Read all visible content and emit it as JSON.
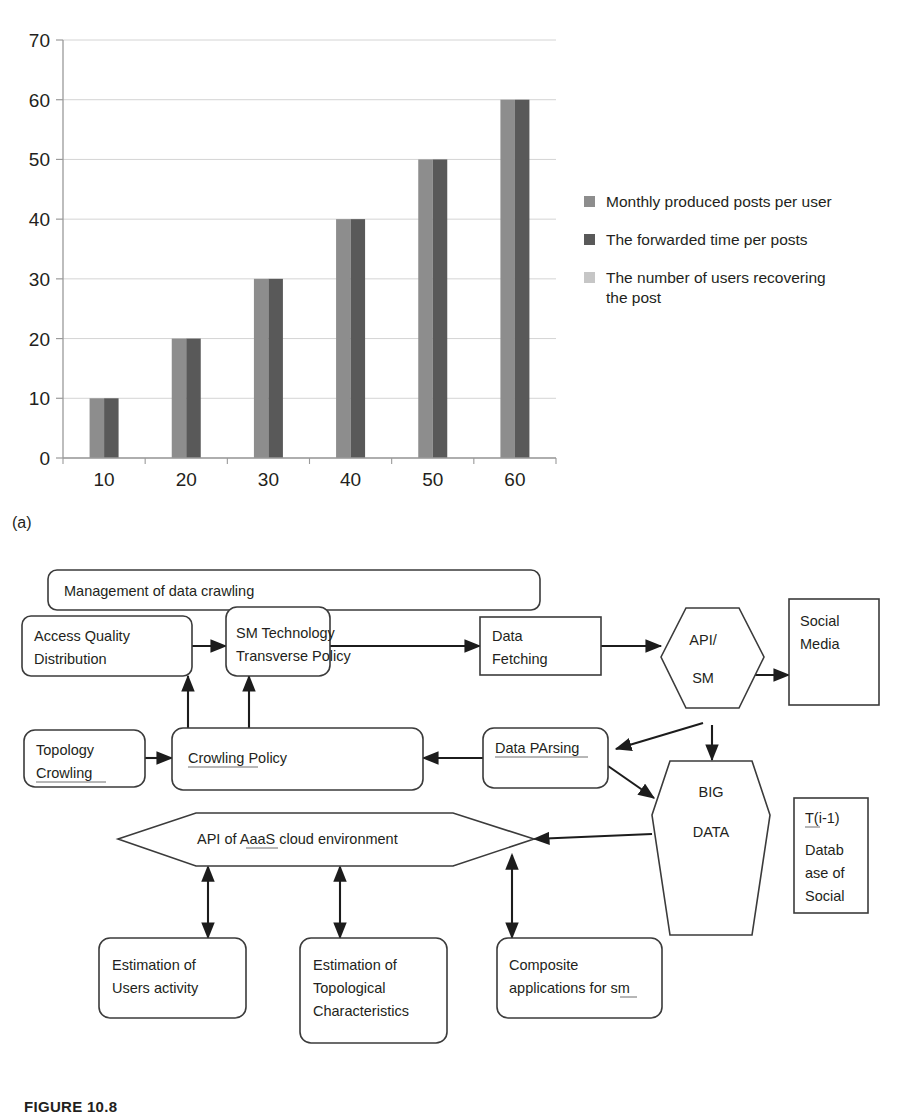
{
  "figure": {
    "caption": "FIGURE 10.8",
    "panel_a_label": "(a)",
    "panel_b_label": "(b)"
  },
  "chart_data": {
    "type": "bar",
    "title": "",
    "xlabel": "",
    "ylabel": "",
    "categories": [
      "10",
      "20",
      "30",
      "40",
      "50",
      "60"
    ],
    "x": [
      10,
      20,
      30,
      40,
      50,
      60
    ],
    "series": [
      {
        "name": "Monthly produced posts per user",
        "color": "#8d8d8d",
        "values": [
          10,
          20,
          30,
          40,
          50,
          60
        ]
      },
      {
        "name": "The forwarded time per posts",
        "color": "#595959",
        "values": [
          10,
          20,
          30,
          40,
          50,
          60
        ]
      },
      {
        "name": "The number of users recovering the post",
        "color": "#c6c6c6",
        "values": [
          0,
          0,
          0,
          0,
          0,
          0
        ]
      }
    ],
    "ylim": [
      0,
      70
    ],
    "yticks": [
      0,
      10,
      20,
      30,
      40,
      50,
      60,
      70
    ],
    "ytick_labels": [
      "0",
      "10",
      "20",
      "30",
      "40",
      "50",
      "60",
      "70"
    ],
    "grid": true,
    "legend_position": "right"
  },
  "legend": {
    "items": [
      {
        "label": "Monthly produced posts per user",
        "color": "#8d8d8d"
      },
      {
        "label": "The forwarded time per posts",
        "color": "#595959"
      },
      {
        "label": "The number of users recovering the post",
        "color": "#c6c6c6"
      }
    ]
  },
  "diagram": {
    "title": "Management of data crawling",
    "nodes": {
      "management": "Management of data crawling",
      "access_quality_l1": "Access Quality",
      "access_quality_l2": "Distribution",
      "sm_tech_l1": "SM Technology",
      "sm_tech_l2": "Transverse Policy",
      "data_fetching_l1": "Data",
      "data_fetching_l2": "Fetching",
      "api_sm_l1": "API/",
      "api_sm_l2": "SM",
      "social_media_l1": "Social",
      "social_media_l2": "Media",
      "topology_l1": "Topology",
      "topology_l2": "Crowling",
      "crowling_policy": "Crowling Policy",
      "data_parsing": "Data PArsing",
      "big_data_l1": "BIG",
      "big_data_l2": "DATA",
      "tdb_l1": "T(i-1)",
      "tdb_l2": "Datab",
      "tdb_l3": "ase of",
      "tdb_l4": "Social",
      "aaas_api": "API of AaaS cloud environment",
      "est_users_l1": "Estimation of",
      "est_users_l2": "Users activity",
      "est_topo_l1": "Estimation of",
      "est_topo_l2": "Topological",
      "est_topo_l3": "Characteristics",
      "composite_l1": "Composite",
      "composite_l2": "applications for sm"
    }
  }
}
